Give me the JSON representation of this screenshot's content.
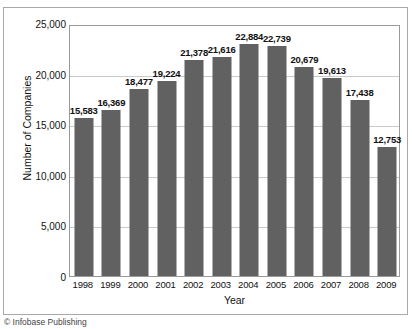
{
  "figure": {
    "title_cropped": "",
    "credit": "© Infobase Publishing"
  },
  "chart_data": {
    "type": "bar",
    "title": "",
    "xlabel": "Year",
    "ylabel": "Number of Companies",
    "categories": [
      "1998",
      "1999",
      "2000",
      "2001",
      "2002",
      "2003",
      "2004",
      "2005",
      "2006",
      "2007",
      "2008",
      "2009"
    ],
    "values": [
      15583,
      16369,
      18477,
      19224,
      21378,
      21616,
      22884,
      22739,
      20679,
      19613,
      17438,
      12753
    ],
    "value_labels": [
      "15,583",
      "16,369",
      "18,477",
      "19,224",
      "21,378",
      "21,616",
      "22,884",
      "22,739",
      "20,679",
      "19,613",
      "17,438",
      "12,753"
    ],
    "ylim": [
      0,
      24900
    ],
    "yticks": [
      0,
      5000,
      10000,
      15000,
      20000,
      25000
    ],
    "ytick_labels": [
      "0",
      "5,000",
      "10,000",
      "15,000",
      "20,000",
      "25,000"
    ],
    "grid": true,
    "grid_axis": "y",
    "legend": false,
    "bar_color": "#616161",
    "grid_color": "#c9c9c9",
    "plot_background": "#ffffff",
    "axis_color": "#9a9a9a"
  }
}
